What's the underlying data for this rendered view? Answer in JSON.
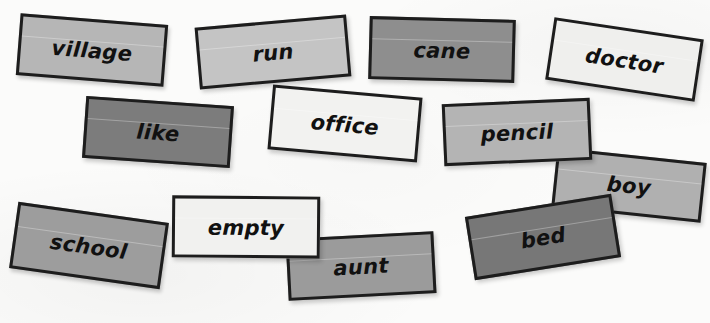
{
  "scene": {
    "description": "Scattered paper word cards on a white surface",
    "background_color": "#fbfbfa",
    "card_count": 13
  },
  "cards": [
    {
      "word": "village",
      "fill": "#b6b6b6",
      "border": "#1d1d1d",
      "text_color": "#111111",
      "left": 18,
      "top": 19,
      "width": 148,
      "height": 62,
      "rotate": 4.5,
      "font_size": 21,
      "z": 3
    },
    {
      "word": "run",
      "fill": "#c4c4c4",
      "border": "#1d1d1d",
      "text_color": "#111111",
      "left": 197,
      "top": 21,
      "width": 152,
      "height": 62,
      "rotate": -5,
      "z": 2,
      "font_size": 21
    },
    {
      "word": "cane",
      "fill": "#8e8e8e",
      "border": "#1d1d1d",
      "text_color": "#111111",
      "left": 369,
      "top": 18,
      "width": 146,
      "height": 63,
      "rotate": 1.5,
      "z": 3,
      "font_size": 21
    },
    {
      "word": "doctor",
      "fill": "#efefed",
      "border": "#1d1d1d",
      "text_color": "#111111",
      "left": 549,
      "top": 28,
      "width": 151,
      "height": 63,
      "rotate": 8.5,
      "z": 2,
      "font_size": 21
    },
    {
      "word": "like",
      "fill": "#7c7c7c",
      "border": "#1d1d1d",
      "text_color": "#111111",
      "left": 84,
      "top": 101,
      "width": 148,
      "height": 62,
      "rotate": 4,
      "z": 4,
      "font_size": 21
    },
    {
      "word": "office",
      "fill": "#f2f2f0",
      "border": "#1d1d1d",
      "text_color": "#111111",
      "left": 270,
      "top": 91,
      "width": 150,
      "height": 65,
      "rotate": 5,
      "z": 5,
      "font_size": 21
    },
    {
      "word": "pencil",
      "fill": "#b4b4b4",
      "border": "#1d1d1d",
      "text_color": "#111111",
      "left": 443,
      "top": 101,
      "width": 148,
      "height": 62,
      "rotate": -2.5,
      "z": 5,
      "font_size": 21
    },
    {
      "word": "boy",
      "fill": "#b0b0b0",
      "border": "#1d1d1d",
      "text_color": "#111111",
      "left": 554,
      "top": 155,
      "width": 150,
      "height": 60,
      "rotate": 6,
      "z": 3,
      "font_size": 21
    },
    {
      "word": "school",
      "fill": "#9d9d9d",
      "border": "#1d1d1d",
      "text_color": "#111111",
      "left": 13,
      "top": 212,
      "width": 152,
      "height": 67,
      "rotate": 8,
      "z": 3,
      "font_size": 21
    },
    {
      "word": "empty",
      "fill": "#f1f1ef",
      "border": "#1d1d1d",
      "text_color": "#111111",
      "left": 172,
      "top": 196,
      "width": 148,
      "height": 62,
      "rotate": 0.5,
      "z": 6,
      "font_size": 21
    },
    {
      "word": "aunt",
      "fill": "#9b9b9b",
      "border": "#1d1d1d",
      "text_color": "#111111",
      "left": 287,
      "top": 235,
      "width": 148,
      "height": 62,
      "rotate": -3,
      "z": 4,
      "font_size": 21
    },
    {
      "word": "bed",
      "fill": "#777777",
      "border": "#1d1d1d",
      "text_color": "#111111",
      "left": 469,
      "top": 205,
      "width": 148,
      "height": 64,
      "rotate": -9,
      "z": 5,
      "font_size": 21
    }
  ]
}
